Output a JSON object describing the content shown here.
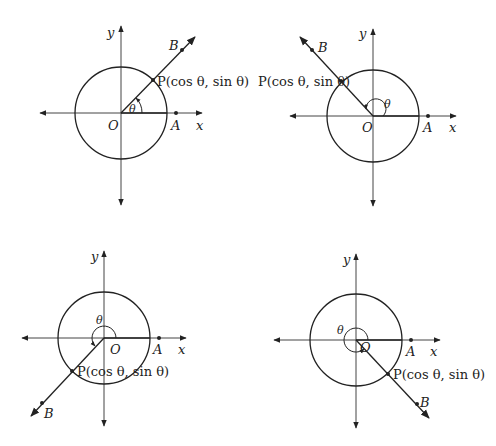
{
  "diagrams": [
    {
      "id": "quadrant-1",
      "origin_label": "O",
      "x_label": "x",
      "y_label": "y",
      "point_a_label": "A",
      "point_b_label": "B",
      "point_p_label": "P(cos θ, sin θ)",
      "angle_label": "θ",
      "angle_deg": 45
    },
    {
      "id": "quadrant-2",
      "origin_label": "O",
      "x_label": "x",
      "y_label": "y",
      "point_a_label": "A",
      "point_b_label": "B",
      "point_p_label": "P(cos θ, sin θ)",
      "angle_label": "θ",
      "angle_deg": 135
    },
    {
      "id": "quadrant-3",
      "origin_label": "O",
      "x_label": "x",
      "y_label": "y",
      "point_a_label": "A",
      "point_b_label": "B",
      "point_p_label": "P(cos θ, sin θ)",
      "angle_label": "θ",
      "angle_deg": 225
    },
    {
      "id": "quadrant-4",
      "origin_label": "O",
      "x_label": "x",
      "y_label": "y",
      "point_a_label": "A",
      "point_b_label": "B",
      "point_p_label": "P(cos θ, sin θ)",
      "angle_label": "θ",
      "angle_deg": 315
    }
  ],
  "colors": {
    "stroke": "#222222",
    "axis": "#555555"
  }
}
